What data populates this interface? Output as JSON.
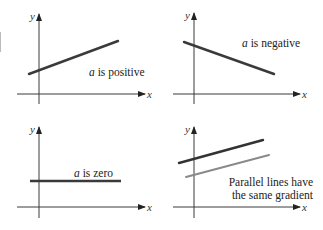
{
  "figure": {
    "panels": [
      {
        "id": "positive",
        "caption_var": "a",
        "caption_rest": " is positive",
        "axis_labels": {
          "x": "x",
          "y": "y"
        },
        "lines": [
          {
            "x1": 29,
            "y1": 74,
            "x2": 118,
            "y2": 41,
            "color": "#3a3a3a",
            "width": 2.4
          }
        ]
      },
      {
        "id": "negative",
        "caption_var": "a",
        "caption_rest": " is negative",
        "axis_labels": {
          "x": "x",
          "y": "y"
        },
        "lines": [
          {
            "x1": 184,
            "y1": 42,
            "x2": 274,
            "y2": 74,
            "color": "#3a3a3a",
            "width": 2.4
          }
        ]
      },
      {
        "id": "zero",
        "caption_var": "a",
        "caption_rest": " is zero",
        "axis_labels": {
          "x": "x",
          "y": "y"
        },
        "lines": [
          {
            "x1": 30,
            "y1": 181,
            "x2": 121,
            "y2": 181,
            "color": "#3a3a3a",
            "width": 2.4
          }
        ]
      },
      {
        "id": "parallel",
        "caption_line1": "Parallel lines have",
        "caption_line2": "the same gradient",
        "axis_labels": {
          "x": "x",
          "y": "y"
        },
        "lines": [
          {
            "x1": 179,
            "y1": 163,
            "x2": 263,
            "y2": 140,
            "color": "#333333",
            "width": 2.4
          },
          {
            "x1": 186,
            "y1": 177,
            "x2": 269,
            "y2": 155,
            "color": "#8a8a8a",
            "width": 2.0
          }
        ]
      }
    ]
  }
}
